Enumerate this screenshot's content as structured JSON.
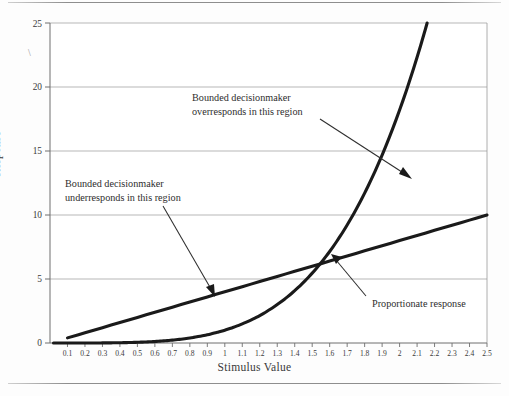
{
  "chart_data": {
    "type": "line",
    "title": "",
    "xlabel": "Stimulus Value",
    "ylabel": "Response",
    "xlim": [
      0,
      2.5
    ],
    "ylim": [
      0,
      25
    ],
    "grid": true,
    "legend_position": "none",
    "xticks": [
      "0.1",
      "0.2",
      "0.3",
      "0.4",
      "0.5",
      "0.6",
      "0.7",
      "0.8",
      "0.9",
      "1",
      "1.1",
      "1.2",
      "1.3",
      "1.4",
      "1.5",
      "1.6",
      "1.7",
      "1.8",
      "1.9",
      "2",
      "2.1",
      "2.2",
      "2.3",
      "2.4",
      "2.5"
    ],
    "yticks": [
      "0",
      "5",
      "10",
      "15",
      "20",
      "25"
    ],
    "x": [
      0.1,
      0.2,
      0.3,
      0.4,
      0.5,
      0.6,
      0.7,
      0.8,
      0.9,
      1.0,
      1.1,
      1.2,
      1.3,
      1.4,
      1.5,
      1.6,
      1.7,
      1.8,
      1.9,
      2.0,
      2.1,
      2.2,
      2.3,
      2.4,
      2.5
    ],
    "series": [
      {
        "name": "Proportionate response",
        "kind": "linear",
        "values": [
          0.4,
          0.8,
          1.2,
          1.6,
          2.0,
          2.4,
          2.8,
          3.2,
          3.6,
          4.0,
          4.4,
          4.8,
          5.2,
          5.6,
          6.0,
          6.4,
          6.8,
          7.2,
          7.6,
          8.0,
          8.4,
          8.8,
          9.2,
          9.6,
          10.0
        ]
      },
      {
        "name": "Bounded decisionmaker response",
        "kind": "exponential",
        "values": [
          0.0,
          0.01,
          0.02,
          0.04,
          0.06,
          0.1,
          0.18,
          0.3,
          0.55,
          1.0,
          1.6,
          2.4,
          3.4,
          4.6,
          6.0,
          6.4,
          9.4,
          11.6,
          14.6,
          18.2,
          22.0,
          25.0,
          null,
          null,
          null
        ]
      }
    ],
    "annotations": [
      {
        "id": "overresponds",
        "lines": [
          "Bounded decisionmaker",
          "overresponds in this region"
        ],
        "points_to": {
          "x": 2.1,
          "y": 13.2
        }
      },
      {
        "id": "underresponds",
        "lines": [
          "Bounded decisionmaker",
          "underresponds in this region"
        ],
        "points_to": {
          "x": 0.98,
          "y": 3.9
        }
      },
      {
        "id": "proportionate",
        "lines": [
          "Proportionate response"
        ],
        "points_to": {
          "x": 1.78,
          "y": 7.1
        }
      }
    ],
    "colors": {
      "curve": "#1a1a1a",
      "grid": "#9a9a9a",
      "axis": "#6e6e6e",
      "text": "#2e2e2e",
      "background": "#fdfdfd"
    },
    "artifacts": [
      "\\"
    ]
  }
}
